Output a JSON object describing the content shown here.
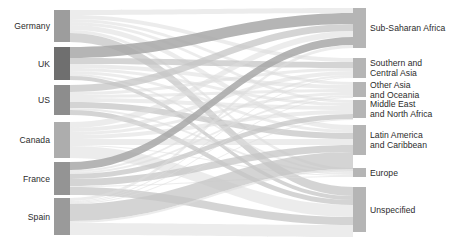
{
  "chart_data": {
    "type": "sankey",
    "title": "",
    "xlabel": "",
    "ylabel": "",
    "orientation": "horizontal",
    "legend": "none",
    "grid": false,
    "colors": {
      "source_node_default": "#9d9d9d",
      "source_node_highlight": "#6f6f6f",
      "target_node": "#b5b5b5",
      "link_light": "#dcdcdc",
      "link_medium": "#c6c6c6",
      "link_dark": "#a8a8a8",
      "label_text": "#2b2b2b",
      "background": "#ffffff"
    },
    "source_nodes": [
      {
        "id": "germany",
        "label": "Germany",
        "value": 32,
        "y0": 10,
        "y1": 42,
        "color": "#9d9d9d"
      },
      {
        "id": "uk",
        "label": "UK",
        "value": 33,
        "y0": 47,
        "y1": 80,
        "color": "#6f6f6f"
      },
      {
        "id": "us",
        "label": "US",
        "value": 30,
        "y0": 85,
        "y1": 115,
        "color": "#8d8d8d"
      },
      {
        "id": "canada",
        "label": "Canada",
        "value": 36,
        "y0": 122,
        "y1": 158,
        "color": "#adadad"
      },
      {
        "id": "france",
        "label": "France",
        "value": 33,
        "y0": 162,
        "y1": 195,
        "color": "#949494"
      },
      {
        "id": "spain",
        "label": "Spain",
        "value": 37,
        "y0": 198,
        "y1": 235,
        "color": "#9a9a9a"
      }
    ],
    "target_nodes": [
      {
        "id": "ssa",
        "label": "Sub-Saharan Africa",
        "label_lines": [
          "Sub-Saharan Africa"
        ],
        "value": 40,
        "y0": 8,
        "y1": 48
      },
      {
        "id": "sca",
        "label": "Southern and Central Asia",
        "label_lines": [
          "Southern and",
          "Central Asia"
        ],
        "value": 20,
        "y0": 58,
        "y1": 78
      },
      {
        "id": "oao",
        "label": "Other Asia and Oceania",
        "label_lines": [
          "Other Asia",
          "and Oceania"
        ],
        "value": 15,
        "y0": 82,
        "y1": 97
      },
      {
        "id": "mena",
        "label": "Middle East and North Africa",
        "label_lines": [
          "Middle East",
          "and North Africa"
        ],
        "value": 18,
        "y0": 100,
        "y1": 118
      },
      {
        "id": "lac",
        "label": "Latin America and Caribbean",
        "label_lines": [
          "Latin America",
          "and Caribbean"
        ],
        "value": 30,
        "y0": 125,
        "y1": 155
      },
      {
        "id": "europe",
        "label": "Europe",
        "label_lines": [
          "Europe"
        ],
        "value": 9,
        "y0": 168,
        "y1": 177
      },
      {
        "id": "unspec",
        "label": "Unspecified",
        "label_lines": [
          "Unspecified"
        ],
        "value": 45,
        "y0": 187,
        "y1": 232
      }
    ],
    "links": [
      {
        "source": "germany",
        "target": "ssa",
        "value": 5,
        "sy0": 10,
        "sy1": 15,
        "ty0": 8,
        "ty1": 13,
        "shade": "light"
      },
      {
        "source": "germany",
        "target": "sca",
        "value": 4,
        "sy0": 15,
        "sy1": 19,
        "ty0": 58,
        "ty1": 62,
        "shade": "light"
      },
      {
        "source": "germany",
        "target": "oao",
        "value": 3,
        "sy0": 19,
        "sy1": 22,
        "ty0": 82,
        "ty1": 85,
        "shade": "light"
      },
      {
        "source": "germany",
        "target": "mena",
        "value": 3,
        "sy0": 22,
        "sy1": 25,
        "ty0": 100,
        "ty1": 103,
        "shade": "light"
      },
      {
        "source": "germany",
        "target": "lac",
        "value": 5,
        "sy0": 25,
        "sy1": 30,
        "ty0": 125,
        "ty1": 130,
        "shade": "light"
      },
      {
        "source": "germany",
        "target": "europe",
        "value": 3,
        "sy0": 30,
        "sy1": 33,
        "ty0": 168,
        "ty1": 171,
        "shade": "light"
      },
      {
        "source": "germany",
        "target": "unspec",
        "value": 9,
        "sy0": 33,
        "sy1": 42,
        "ty0": 187,
        "ty1": 196,
        "shade": "medium"
      },
      {
        "source": "uk",
        "target": "ssa",
        "value": 11,
        "sy0": 47,
        "sy1": 58,
        "ty0": 13,
        "ty1": 24,
        "shade": "dark"
      },
      {
        "source": "uk",
        "target": "sca",
        "value": 6,
        "sy0": 58,
        "sy1": 64,
        "ty0": 62,
        "ty1": 68,
        "shade": "medium"
      },
      {
        "source": "uk",
        "target": "oao",
        "value": 4,
        "sy0": 64,
        "sy1": 68,
        "ty0": 85,
        "ty1": 89,
        "shade": "light"
      },
      {
        "source": "uk",
        "target": "mena",
        "value": 3,
        "sy0": 68,
        "sy1": 71,
        "ty0": 103,
        "ty1": 106,
        "shade": "light"
      },
      {
        "source": "uk",
        "target": "lac",
        "value": 3,
        "sy0": 71,
        "sy1": 74,
        "ty0": 130,
        "ty1": 133,
        "shade": "light"
      },
      {
        "source": "uk",
        "target": "europe",
        "value": 2,
        "sy0": 74,
        "sy1": 76,
        "ty0": 171,
        "ty1": 173,
        "shade": "light"
      },
      {
        "source": "uk",
        "target": "unspec",
        "value": 4,
        "sy0": 76,
        "sy1": 80,
        "ty0": 196,
        "ty1": 200,
        "shade": "medium"
      },
      {
        "source": "us",
        "target": "ssa",
        "value": 7,
        "sy0": 85,
        "sy1": 92,
        "ty0": 24,
        "ty1": 31,
        "shade": "medium"
      },
      {
        "source": "us",
        "target": "sca",
        "value": 3,
        "sy0": 92,
        "sy1": 95,
        "ty0": 68,
        "ty1": 71,
        "shade": "light"
      },
      {
        "source": "us",
        "target": "oao",
        "value": 3,
        "sy0": 95,
        "sy1": 98,
        "ty0": 89,
        "ty1": 92,
        "shade": "light"
      },
      {
        "source": "us",
        "target": "mena",
        "value": 4,
        "sy0": 98,
        "sy1": 102,
        "ty0": 106,
        "ty1": 110,
        "shade": "light"
      },
      {
        "source": "us",
        "target": "lac",
        "value": 6,
        "sy0": 102,
        "sy1": 108,
        "ty0": 133,
        "ty1": 139,
        "shade": "medium"
      },
      {
        "source": "us",
        "target": "europe",
        "value": 2,
        "sy0": 108,
        "sy1": 110,
        "ty0": 173,
        "ty1": 175,
        "shade": "light"
      },
      {
        "source": "us",
        "target": "unspec",
        "value": 5,
        "sy0": 110,
        "sy1": 115,
        "ty0": 200,
        "ty1": 205,
        "shade": "medium"
      },
      {
        "source": "canada",
        "target": "ssa",
        "value": 6,
        "sy0": 122,
        "sy1": 128,
        "ty0": 31,
        "ty1": 37,
        "shade": "light"
      },
      {
        "source": "canada",
        "target": "sca",
        "value": 4,
        "sy0": 128,
        "sy1": 132,
        "ty0": 71,
        "ty1": 75,
        "shade": "light"
      },
      {
        "source": "canada",
        "target": "oao",
        "value": 3,
        "sy0": 132,
        "sy1": 135,
        "ty0": 92,
        "ty1": 95,
        "shade": "light"
      },
      {
        "source": "canada",
        "target": "mena",
        "value": 4,
        "sy0": 135,
        "sy1": 139,
        "ty0": 110,
        "ty1": 114,
        "shade": "light"
      },
      {
        "source": "canada",
        "target": "lac",
        "value": 6,
        "sy0": 139,
        "sy1": 145,
        "ty0": 139,
        "ty1": 145,
        "shade": "light"
      },
      {
        "source": "canada",
        "target": "europe",
        "value": 1,
        "sy0": 145,
        "sy1": 146,
        "ty0": 175,
        "ty1": 176,
        "shade": "light"
      },
      {
        "source": "canada",
        "target": "unspec",
        "value": 12,
        "sy0": 146,
        "sy1": 158,
        "ty0": 205,
        "ty1": 217,
        "shade": "light"
      },
      {
        "source": "france",
        "target": "ssa",
        "value": 8,
        "sy0": 162,
        "sy1": 170,
        "ty0": 37,
        "ty1": 45,
        "shade": "dark"
      },
      {
        "source": "france",
        "target": "sca",
        "value": 2,
        "sy0": 170,
        "sy1": 172,
        "ty0": 75,
        "ty1": 77,
        "shade": "light"
      },
      {
        "source": "france",
        "target": "oao",
        "value": 2,
        "sy0": 172,
        "sy1": 174,
        "ty0": 95,
        "ty1": 97,
        "shade": "light"
      },
      {
        "source": "france",
        "target": "mena",
        "value": 5,
        "sy0": 174,
        "sy1": 179,
        "ty0": 114,
        "ty1": 119,
        "shade": "medium"
      },
      {
        "source": "france",
        "target": "lac",
        "value": 7,
        "sy0": 179,
        "sy1": 186,
        "ty0": 145,
        "ty1": 152,
        "shade": "medium"
      },
      {
        "source": "france",
        "target": "europe",
        "value": 1,
        "sy0": 186,
        "sy1": 187,
        "ty0": 176,
        "ty1": 177,
        "shade": "light"
      },
      {
        "source": "france",
        "target": "unspec",
        "value": 8,
        "sy0": 187,
        "sy1": 195,
        "ty0": 217,
        "ty1": 225,
        "shade": "medium"
      },
      {
        "source": "spain",
        "target": "ssa",
        "value": 3,
        "sy0": 198,
        "sy1": 201,
        "ty0": 45,
        "ty1": 48,
        "shade": "light"
      },
      {
        "source": "spain",
        "target": "sca",
        "value": 1,
        "sy0": 201,
        "sy1": 202,
        "ty0": 77,
        "ty1": 78,
        "shade": "light"
      },
      {
        "source": "spain",
        "target": "oao",
        "value": 1,
        "sy0": 202,
        "sy1": 203,
        "ty0": 97,
        "ty1": 98,
        "shade": "light"
      },
      {
        "source": "spain",
        "target": "mena",
        "value": 1,
        "sy0": 203,
        "sy1": 204,
        "ty0": 119,
        "ty1": 120,
        "shade": "light"
      },
      {
        "source": "spain",
        "target": "lac",
        "value": 17,
        "sy0": 204,
        "sy1": 221,
        "ty0": 152,
        "ty1": 169,
        "shade": "medium"
      },
      {
        "source": "spain",
        "target": "europe",
        "value": 2,
        "sy0": 221,
        "sy1": 223,
        "ty0": 169,
        "ty1": 171,
        "shade": "light"
      },
      {
        "source": "spain",
        "target": "unspec",
        "value": 12,
        "sy0": 223,
        "sy1": 235,
        "ty0": 225,
        "ty1": 237,
        "shade": "light"
      }
    ]
  },
  "layout": {
    "source_node_x": 54,
    "source_node_width": 16,
    "target_node_x": 353,
    "target_node_width": 13,
    "left_label_right_edge": 50,
    "right_label_left_edge": 370
  }
}
